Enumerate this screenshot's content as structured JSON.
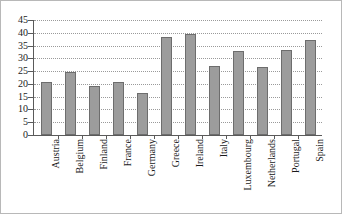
{
  "chart_data": {
    "type": "bar",
    "title": "",
    "subtitle": "",
    "xlabel": "",
    "ylabel": "",
    "categories": [
      "Austria",
      "Belgium",
      "Finland",
      "France",
      "Germany",
      "Greece",
      "Ireland",
      "Italy",
      "Luxembourg",
      "Netherlands",
      "Portugal",
      "Spain"
    ],
    "values": [
      20.7,
      24.8,
      19.3,
      20.7,
      16.6,
      38.5,
      39.5,
      27.0,
      32.8,
      26.8,
      33.4,
      37.0
    ],
    "ylim": [
      0,
      45
    ],
    "ytick_step": 5,
    "yticks": [
      0,
      5,
      10,
      15,
      20,
      25,
      30,
      35,
      40,
      45
    ],
    "ytick_labels": [
      "0",
      "5",
      "10",
      "15",
      "20",
      "25",
      "30",
      "35",
      "40",
      "45"
    ],
    "grid": true,
    "grid_axis": "y",
    "grid_style": "dotted",
    "legend": false,
    "legend_position": "none",
    "series": [
      {
        "name": "",
        "values": [
          20.7,
          24.8,
          19.3,
          20.7,
          16.6,
          38.5,
          39.5,
          27.0,
          32.8,
          26.8,
          33.4,
          37.0
        ]
      }
    ]
  },
  "style": {
    "bar_fill": "#9c9c9c",
    "bar_border": "#6d6d6d",
    "axis_color": "#5a5a5a",
    "grid_color": "#9a9a9a",
    "text_color": "#1a1a1a",
    "background": "#ffffff",
    "frame_border": "#b8b8b8"
  }
}
